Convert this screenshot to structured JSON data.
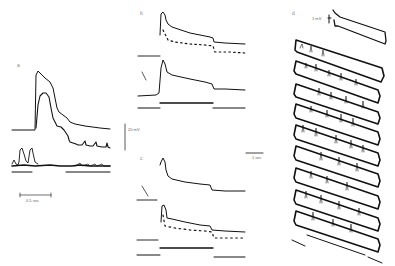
{
  "figure": {
    "panels": [
      {
        "id": "a",
        "label": "a",
        "scale_bars": {
          "voltage": "20 mV",
          "time": "0.5 sec"
        }
      },
      {
        "id": "b",
        "label": "b"
      },
      {
        "id": "c",
        "label": "c",
        "scale_bars": {
          "time": "1 sec"
        }
      },
      {
        "id": "d",
        "label": "d",
        "scale_bars": {
          "voltage": "1 mV"
        }
      }
    ]
  },
  "colors": {
    "trace": "#111111",
    "background": "#ffffff",
    "label": "#777777"
  }
}
